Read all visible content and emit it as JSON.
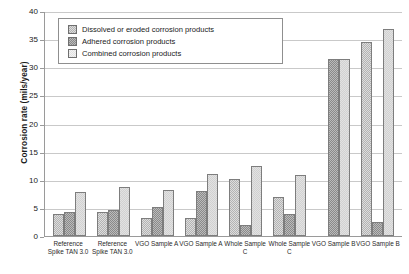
{
  "chart_data": {
    "type": "bar",
    "title": "",
    "xlabel": "",
    "ylabel": "Corrosion rate (mils/year)",
    "ylim": [
      0,
      40
    ],
    "ytick_step": 5,
    "yticks": [
      "0",
      "5",
      "10",
      "15",
      "20",
      "25",
      "30",
      "35",
      "40"
    ],
    "grid": true,
    "legend_position": "top-left-inside",
    "categories": [
      "Reference\nSpike TAN 3.0",
      "Reference\nSpike TAN 3.0",
      "VGO Sample A",
      "VGO Sample A",
      "Whole Sample\nC",
      "Whole Sample\nC",
      "VGO Sample B",
      "VGO Sample B"
    ],
    "series": [
      {
        "name": "Dissolved or eroded corrosion products",
        "swatch": "s0",
        "values": [
          3.9,
          4.2,
          3.2,
          3.2,
          10.2,
          7.0,
          0,
          34.5
        ]
      },
      {
        "name": "Adhered corrosion products",
        "swatch": "s1",
        "values": [
          4.2,
          4.7,
          5.2,
          8.0,
          2.0,
          4.0,
          31.5,
          2.5
        ]
      },
      {
        "name": "Combined corrosion products",
        "swatch": "s2",
        "values": [
          7.8,
          8.7,
          8.2,
          11.0,
          12.4,
          10.8,
          31.5,
          36.8
        ]
      }
    ]
  }
}
